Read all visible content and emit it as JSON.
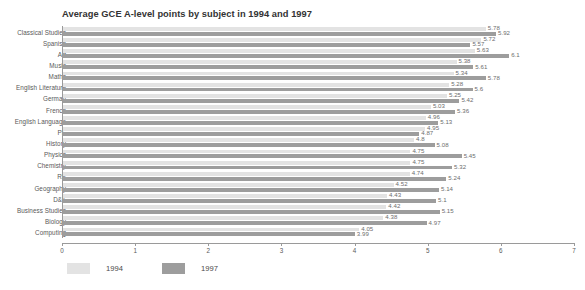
{
  "top_sliver_text": "",
  "chart_data": {
    "type": "bar",
    "orientation": "horizontal",
    "title": "Average GCE A-level points by subject in 1994 and 1997",
    "xlabel": "",
    "ylabel": "",
    "xlim": [
      0,
      7
    ],
    "xticks": [
      "0",
      "1",
      "2",
      "3",
      "4",
      "5",
      "6",
      "7"
    ],
    "grid": false,
    "legend_position": "bottom-left",
    "categories": [
      "Classical Studies",
      "Spanish",
      "Art",
      "Music",
      "Maths",
      "English Literature",
      "German",
      "French",
      "English Language",
      "PE",
      "History",
      "Physics",
      "Chemistry",
      "RE",
      "Geography",
      "D&T",
      "Business Studies",
      "Biology",
      "Computing"
    ],
    "series": [
      {
        "name": "1994",
        "color": "#e3e3e3",
        "values": [
          5.78,
          5.72,
          5.63,
          5.38,
          5.34,
          5.28,
          5.25,
          5.03,
          4.96,
          4.95,
          4.8,
          4.75,
          4.75,
          4.74,
          4.52,
          4.43,
          4.42,
          4.38,
          4.05
        ]
      },
      {
        "name": "1997",
        "color": "#9d9d9d",
        "values": [
          5.92,
          5.57,
          6.1,
          5.61,
          5.78,
          5.6,
          5.42,
          5.36,
          5.13,
          4.87,
          5.08,
          5.45,
          5.32,
          5.24,
          5.14,
          5.1,
          5.15,
          4.97,
          3.99
        ]
      }
    ]
  }
}
